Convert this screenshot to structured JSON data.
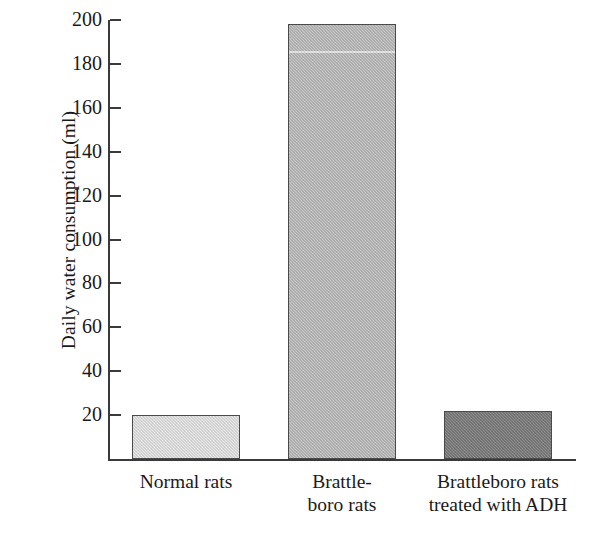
{
  "chart_data": {
    "type": "bar",
    "title": "",
    "subtitle": "",
    "xlabel": "",
    "ylabel": "Daily water consumption (ml)",
    "categories": [
      "Normal rats",
      "Brattleboro rats",
      "Brattleboro rats treated with ADH"
    ],
    "category_lines": [
      [
        "Normal rats"
      ],
      [
        "Brattle-",
        "boro rats"
      ],
      [
        "Brattleboro rats",
        "treated with ADH"
      ]
    ],
    "values": [
      20,
      198,
      22
    ],
    "ylim": [
      0,
      200
    ],
    "yticks": [
      20,
      40,
      60,
      80,
      100,
      120,
      140,
      160,
      180,
      200
    ],
    "ytick_labels": [
      "20",
      "40",
      "60",
      "80",
      "100",
      "120",
      "140",
      "160",
      "180",
      "200"
    ],
    "grid": false,
    "legend": "none",
    "bar_colors": [
      "#e4e4e4",
      "#c4c4c4",
      "#8b8b8b"
    ],
    "bar_edge_color": "#4a4a4a",
    "axis_color": "#3a3a3a",
    "background_color": "#ffffff"
  },
  "axes": {
    "y_axis_title": "Daily water consumption (ml)"
  }
}
